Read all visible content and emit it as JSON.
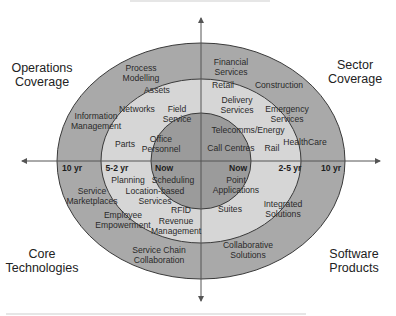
{
  "colors": {
    "outer_ring": "#a9a9a9",
    "middle_ring": "#d6d6d6",
    "inner_circle": "#9b9b9b",
    "ring_stroke": "#3a3a3a",
    "axis": "#555555",
    "text": "#2a2a2a"
  },
  "quadrants": {
    "top_left": [
      "Operations",
      "Coverage"
    ],
    "top_right": [
      "Sector",
      "Coverage"
    ],
    "bottom_left": [
      "Core",
      "Technologies"
    ],
    "bottom_right": [
      "Software",
      "Products"
    ]
  },
  "axis_ticks": {
    "left_outer": "10 yr",
    "left_middle": "5-2 yr",
    "left_inner": "Now",
    "right_inner": "Now",
    "right_middle": "2-5 yr",
    "right_outer": "10 yr"
  },
  "items": {
    "operations": [
      "Process\nModelling",
      "Assets",
      "Networks",
      "Field\nService",
      "Information\nManagement",
      "Parts",
      "Office\nPersonnel"
    ],
    "sector": [
      "Financial\nServices",
      "Retail",
      "Construction",
      "Delivery\nServices",
      "Emergency\nServices",
      "Telecomms/Energy",
      "HealthCare",
      "Call Centres",
      "Rail"
    ],
    "core": [
      "Planning",
      "Scheduling",
      "Service\nMarketplaces",
      "Location-based\nServices",
      "Employee\nEmpowerment",
      "RFID",
      "Revenue\nManagement",
      "Service Chain\nCollaboration"
    ],
    "software": [
      "Point\nApplications",
      "Suites",
      "Integrated\nSolutions",
      "Collaborative\nSolutions"
    ]
  }
}
